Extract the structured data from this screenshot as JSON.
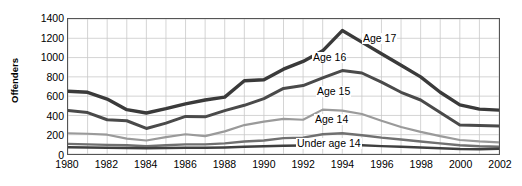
{
  "chart_data": {
    "type": "line",
    "title": "",
    "xlabel": "",
    "ylabel": "Offenders",
    "xlim": [
      1980,
      2002
    ],
    "ylim": [
      0,
      1400
    ],
    "yticks": [
      0,
      200,
      400,
      600,
      800,
      1000,
      1200,
      1400
    ],
    "xticks": [
      1980,
      1982,
      1984,
      1986,
      1988,
      1990,
      1992,
      1994,
      1996,
      1998,
      2000,
      2002
    ],
    "grid": "both, every 1 year vertically and every 200 offenders horizontally",
    "legend_position": "inline annotations on curves",
    "x": [
      1980,
      1981,
      1982,
      1983,
      1984,
      1985,
      1986,
      1987,
      1988,
      1989,
      1990,
      1991,
      1992,
      1993,
      1994,
      1995,
      1996,
      1997,
      1998,
      1999,
      2000,
      2001,
      2002
    ],
    "series": [
      {
        "name": "Age 17",
        "label": "Age 17",
        "color": "#3a3a3a",
        "width": 3.4,
        "values": [
          650,
          640,
          570,
          460,
          425,
          470,
          520,
          560,
          590,
          760,
          770,
          880,
          960,
          1070,
          1280,
          1160,
          1040,
          920,
          800,
          640,
          510,
          465,
          455
        ]
      },
      {
        "name": "Age 16",
        "label": "Age 16",
        "color": "#4a4a4a",
        "width": 3.0,
        "values": [
          450,
          430,
          355,
          345,
          265,
          320,
          390,
          385,
          450,
          505,
          575,
          680,
          710,
          790,
          865,
          840,
          745,
          640,
          560,
          430,
          300,
          295,
          290
        ]
      },
      {
        "name": "Age 15",
        "label": "Age 15",
        "color": "#9a9a9a",
        "width": 2.2,
        "values": [
          215,
          210,
          200,
          160,
          140,
          175,
          205,
          185,
          235,
          300,
          335,
          365,
          355,
          460,
          450,
          415,
          345,
          280,
          230,
          185,
          145,
          130,
          120
        ]
      },
      {
        "name": "Age 14",
        "label": "Age 14",
        "color": "#707070",
        "width": 2.4,
        "values": [
          105,
          100,
          95,
          90,
          80,
          90,
          100,
          100,
          110,
          130,
          140,
          165,
          170,
          205,
          215,
          195,
          170,
          150,
          130,
          110,
          90,
          80,
          75
        ]
      },
      {
        "name": "Under age 14",
        "label": "Under age 14",
        "color": "#3f3f3f",
        "width": 2.4,
        "values": [
          70,
          68,
          65,
          62,
          60,
          62,
          65,
          65,
          68,
          75,
          80,
          85,
          88,
          95,
          95,
          90,
          82,
          75,
          68,
          60,
          52,
          50,
          55
        ]
      }
    ],
    "annotations": [
      {
        "text": "Age 17",
        "x_px": 362,
        "y_px": 33
      },
      {
        "text": "Age 16",
        "x_px": 312,
        "y_px": 52
      },
      {
        "text": "Age 15",
        "x_px": 316,
        "y_px": 86
      },
      {
        "text": "Age 14",
        "x_px": 314,
        "y_px": 114
      },
      {
        "text": "Under age 14",
        "x_px": 296,
        "y_px": 138
      }
    ]
  }
}
